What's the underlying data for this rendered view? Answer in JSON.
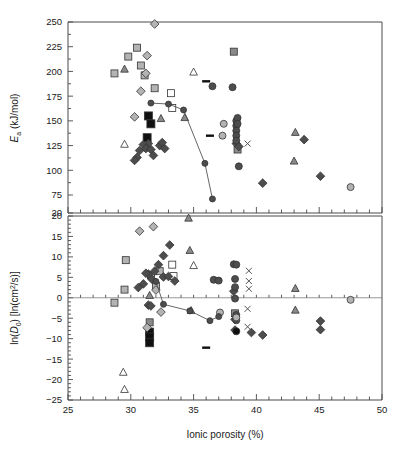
{
  "figure": {
    "title": "",
    "background": "#ffffff",
    "width": 405,
    "height": 459
  },
  "axes": {
    "x": {
      "label": "Ionic porosity (%)",
      "min": 25,
      "max": 50,
      "ticks": [
        25,
        30,
        35,
        40,
        45,
        50
      ],
      "tick_labels": [
        "25",
        "30",
        "35",
        "40",
        "45",
        "50"
      ],
      "minor_tick_step": 1
    },
    "y_top": {
      "label_main": "E",
      "label_sub": "a",
      "label_unit": " (kJ/mol)",
      "label_full": "Ea (kJ/mol)",
      "min": 20,
      "max": 250,
      "ticks": [
        20,
        75,
        100,
        125,
        150,
        175,
        200,
        225,
        250
      ],
      "tick_labels": [
        "20",
        "75",
        "100",
        "125",
        "150",
        "175",
        "200",
        "225",
        "250"
      ],
      "axis_break_below": 75
    },
    "y_bottom": {
      "label_full": "ln(D0) [ln(cm2/s)]",
      "label_prefix": "ln(",
      "label_var": "D",
      "label_var_sub": "0",
      "label_suffix": ") [ln(cm",
      "label_sup": "2",
      "label_tail": "/s)]",
      "min": -25,
      "max": 20,
      "ticks": [
        -25,
        -20,
        -15,
        -10,
        -5,
        0,
        5,
        10,
        15,
        20
      ],
      "tick_labels": [
        "−25",
        "−20",
        "−15",
        "−10",
        "−5",
        "0",
        "5",
        "10",
        "15",
        "20"
      ],
      "minor_tick_step": 1
    }
  },
  "colors": {
    "axis": "#4a4a4a",
    "text": "#1a1a1a",
    "trendline": "#555555",
    "black_fill": "#101010",
    "dark_gray_fill": "#4d4d4d",
    "mid_gray_fill": "#808080",
    "light_gray_fill": "#b3b3b3",
    "open_fill": "#ffffff",
    "marker_stroke": "#333333"
  },
  "chart_data": {
    "type": "scatter",
    "title": "",
    "xlabel": "Ionic porosity (%)",
    "panels": [
      {
        "id": "top",
        "ylabel": "Ea (kJ/mol)",
        "ylim": [
          20,
          250
        ],
        "xlim": [
          25,
          50
        ],
        "grid": false,
        "legend": "none",
        "series": [
          {
            "name": "light-gray-square",
            "marker": "square",
            "fill": "#b3b3b3",
            "size": 7,
            "points": [
              [
                28.7,
                198
              ],
              [
                29.8,
                215
              ],
              [
                30.5,
                224
              ],
              [
                30.8,
                206
              ],
              [
                31.1,
                196
              ],
              [
                31.9,
                183
              ]
            ]
          },
          {
            "name": "mid-gray-square",
            "marker": "square",
            "fill": "#8a8a8a",
            "size": 7,
            "points": [
              [
                38.2,
                220
              ],
              [
                38.5,
                121
              ]
            ]
          },
          {
            "name": "open-square",
            "marker": "square",
            "fill": "#ffffff",
            "size": 7,
            "points": [
              [
                33.2,
                178
              ],
              [
                33.3,
                163
              ]
            ]
          },
          {
            "name": "black-square",
            "marker": "square",
            "fill": "#101010",
            "size": 8,
            "points": [
              [
                31.4,
                155
              ],
              [
                31.6,
                147
              ],
              [
                31.3,
                133
              ]
            ]
          },
          {
            "name": "mid-gray-triangle",
            "marker": "triangle",
            "fill": "#8a8a8a",
            "size": 7,
            "points": [
              [
                29.5,
                202
              ],
              [
                32.4,
                152
              ],
              [
                34.3,
                153
              ],
              [
                43.1,
                138
              ],
              [
                43.0,
                109
              ]
            ]
          },
          {
            "name": "open-triangle",
            "marker": "triangle",
            "fill": "#ffffff",
            "size": 7,
            "points": [
              [
                35.0,
                199
              ],
              [
                29.5,
                126
              ]
            ]
          },
          {
            "name": "light-gray-diamond",
            "marker": "diamond",
            "fill": "#b3b3b3",
            "size": 7,
            "points": [
              [
                31.9,
                248
              ],
              [
                31.3,
                216
              ],
              [
                31.2,
                198
              ],
              [
                30.8,
                180
              ],
              [
                30.3,
                154
              ]
            ]
          },
          {
            "name": "dark-gray-diamond",
            "marker": "diamond",
            "fill": "#4d4d4d",
            "size": 7,
            "points": [
              [
                31.4,
                127
              ],
              [
                30.7,
                120
              ],
              [
                30.5,
                113
              ],
              [
                30.3,
                110
              ],
              [
                31.0,
                126
              ],
              [
                31.2,
                122
              ],
              [
                31.6,
                121
              ],
              [
                31.8,
                115
              ],
              [
                32.3,
                125
              ],
              [
                32.5,
                128
              ],
              [
                32.7,
                122
              ],
              [
                38.4,
                127
              ],
              [
                38.6,
                124
              ],
              [
                40.5,
                87
              ],
              [
                43.8,
                131
              ],
              [
                45.1,
                94
              ]
            ]
          },
          {
            "name": "dark-circle",
            "marker": "circle",
            "fill": "#4d4d4d",
            "size": 7,
            "points": [
              [
                36.5,
                185
              ],
              [
                38.1,
                184
              ],
              [
                38.4,
                150
              ],
              [
                38.4,
                145
              ],
              [
                38.4,
                140
              ],
              [
                38.4,
                135
              ],
              [
                38.4,
                130
              ],
              [
                38.5,
                153
              ],
              [
                38.5,
                147
              ],
              [
                38.6,
                104
              ]
            ]
          },
          {
            "name": "light-circle",
            "marker": "circle",
            "fill": "#b3b3b3",
            "size": 7,
            "points": [
              [
                37.4,
                147
              ],
              [
                37.3,
                135
              ],
              [
                47.5,
                83
              ]
            ]
          },
          {
            "name": "cross-x",
            "marker": "x",
            "fill": "none",
            "size": 6,
            "points": [
              [
                39.3,
                127
              ]
            ]
          },
          {
            "name": "black-dash",
            "marker": "dash",
            "fill": "#101010",
            "size": 8,
            "points": [
              [
                36.0,
                190
              ],
              [
                36.3,
                135
              ]
            ]
          },
          {
            "name": "trend-circles",
            "marker": "circle",
            "fill": "#4d4d4d",
            "size": 6,
            "connected": true,
            "points": [
              [
                31.6,
                168
              ],
              [
                33.0,
                167
              ],
              [
                34.2,
                161
              ],
              [
                35.9,
                107
              ],
              [
                36.5,
                71
              ]
            ]
          }
        ]
      },
      {
        "id": "bottom",
        "ylabel": "ln(D0) [ln(cm2/s)]",
        "ylim": [
          -25,
          20
        ],
        "xlim": [
          25,
          50
        ],
        "grid": false,
        "legend": "none",
        "series": [
          {
            "name": "light-gray-square",
            "marker": "square",
            "fill": "#b3b3b3",
            "size": 7,
            "points": [
              [
                28.7,
                -1.2
              ],
              [
                29.5,
                2.0
              ],
              [
                29.6,
                9.2
              ],
              [
                31.6,
                5.5
              ],
              [
                32.0,
                2.9
              ],
              [
                32.3,
                6.5
              ]
            ]
          },
          {
            "name": "mid-gray-square",
            "marker": "square",
            "fill": "#8a8a8a",
            "size": 7,
            "points": [
              [
                31.5,
                -6.0
              ],
              [
                38.3,
                -3.8
              ]
            ]
          },
          {
            "name": "open-square",
            "marker": "square",
            "fill": "#ffffff",
            "size": 7,
            "points": [
              [
                33.3,
                8.1
              ],
              [
                33.4,
                5.3
              ]
            ]
          },
          {
            "name": "black-square",
            "marker": "square",
            "fill": "#101010",
            "size": 8,
            "points": [
              [
                31.5,
                -8.4
              ],
              [
                31.5,
                -9.6
              ],
              [
                31.5,
                -11.0
              ]
            ]
          },
          {
            "name": "mid-gray-triangle",
            "marker": "triangle",
            "fill": "#8a8a8a",
            "size": 7,
            "points": [
              [
                34.6,
                19.4
              ],
              [
                34.7,
                11.5
              ],
              [
                31.5,
                0.5
              ],
              [
                34.8,
                -3.2
              ],
              [
                43.1,
                2.2
              ],
              [
                43.1,
                -3.1
              ]
            ]
          },
          {
            "name": "open-triangle",
            "marker": "triangle",
            "fill": "#ffffff",
            "size": 7,
            "points": [
              [
                35.0,
                7.8
              ],
              [
                29.4,
                -18.3
              ],
              [
                29.5,
                -22.5
              ]
            ]
          },
          {
            "name": "light-gray-diamond",
            "marker": "diamond",
            "fill": "#b3b3b3",
            "size": 7,
            "points": [
              [
                30.7,
                16.3
              ],
              [
                31.8,
                17.4
              ],
              [
                32.0,
                1.9
              ],
              [
                32.4,
                -3.5
              ],
              [
                31.3,
                -7.3
              ]
            ]
          },
          {
            "name": "dark-gray-diamond",
            "marker": "diamond",
            "fill": "#4d4d4d",
            "size": 7,
            "points": [
              [
                33.1,
                12.9
              ],
              [
                32.6,
                10.3
              ],
              [
                32.2,
                8.1
              ],
              [
                31.9,
                6.5
              ],
              [
                31.4,
                5.8
              ],
              [
                31.0,
                3.4
              ],
              [
                30.6,
                2.5
              ],
              [
                31.2,
                6.0
              ],
              [
                31.7,
                4.5
              ],
              [
                32.6,
                5.1
              ],
              [
                31.4,
                -1.8
              ],
              [
                31.6,
                -2.0
              ],
              [
                33.0,
                5.2
              ],
              [
                33.5,
                4.1
              ],
              [
                38.2,
                1.6
              ],
              [
                38.3,
                -5.3
              ],
              [
                38.3,
                -7.9
              ],
              [
                39.6,
                -8.5
              ],
              [
                40.5,
                -9.1
              ],
              [
                45.1,
                -5.7
              ],
              [
                45.1,
                -7.8
              ]
            ]
          },
          {
            "name": "dark-circle",
            "marker": "circle",
            "fill": "#4d4d4d",
            "size": 7,
            "points": [
              [
                36.6,
                4.4
              ],
              [
                37.0,
                4.2
              ],
              [
                38.2,
                8.2
              ],
              [
                38.4,
                8.1
              ],
              [
                38.3,
                4.6
              ],
              [
                38.3,
                2.6
              ],
              [
                38.3,
                -0.2
              ],
              [
                38.4,
                -4.2
              ],
              [
                38.4,
                -5.5
              ]
            ]
          },
          {
            "name": "light-circle",
            "marker": "circle",
            "fill": "#b3b3b3",
            "size": 7,
            "points": [
              [
                37.1,
                -3.6
              ],
              [
                38.4,
                -4.8
              ],
              [
                47.5,
                -0.5
              ]
            ]
          },
          {
            "name": "black-circle",
            "marker": "circle",
            "fill": "#101010",
            "size": 7,
            "points": [
              [
                38.4,
                -8.2
              ]
            ]
          },
          {
            "name": "cross-x",
            "marker": "x",
            "fill": "none",
            "size": 6,
            "points": [
              [
                39.4,
                6.6
              ],
              [
                39.4,
                4.1
              ],
              [
                39.4,
                2.2
              ],
              [
                39.3,
                -2.7
              ],
              [
                39.3,
                -7.1
              ]
            ]
          },
          {
            "name": "black-dash",
            "marker": "dash",
            "fill": "#101010",
            "size": 8,
            "points": [
              [
                36.0,
                -12.2
              ]
            ]
          },
          {
            "name": "trend-circles",
            "marker": "circle",
            "fill": "#4d4d4d",
            "size": 6,
            "connected": true,
            "points": [
              [
                32.0,
                4.0
              ],
              [
                32.6,
                -1.6
              ],
              [
                34.7,
                -3.2
              ],
              [
                36.3,
                -5.6
              ],
              [
                37.0,
                -4.6
              ]
            ]
          }
        ]
      }
    ]
  }
}
